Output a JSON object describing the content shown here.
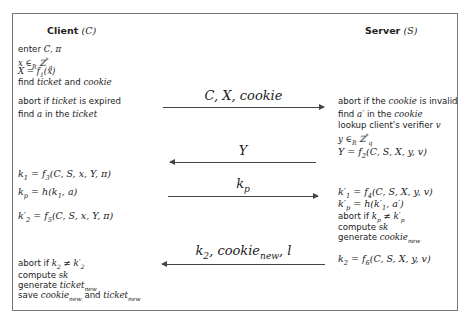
{
  "diagram": {
    "type": "protocol-sequence",
    "client": {
      "title": "Client",
      "symbol": "(C)",
      "steps": [
        "enter C, π",
        "x ∈R Z*q",
        "X = f1(x)",
        "find ticket and cookie",
        "abort if ticket is expired",
        "find a in the ticket",
        "k1 = f3(C, S, x, Y, π)",
        "kp = h(k1, a)",
        "k'2 = f5(C, S, x, Y, π)",
        "abort if k2 ≠ k'2",
        "compute sk",
        "generate ticket_new",
        "save cookie_new and ticket_new"
      ]
    },
    "server": {
      "title": "Server",
      "symbol": "(S)",
      "steps": [
        "abort if the cookie is invalid",
        "find a' in the cookie",
        "lookup client's verifier v",
        "y ∈R Z*q",
        "Y = f2(C, S, X, y, v)",
        "k'1 = f4(C, S, X, y, v)",
        "k'p = h(k'1, a')",
        "abort if kp ≠ k'p",
        "compute sk",
        "generate cookie_new",
        "k2 = f6(C, S, X, y, v)"
      ]
    },
    "messages": [
      {
        "direction": "client-to-server",
        "label": "C, X, cookie"
      },
      {
        "direction": "server-to-client",
        "label": "Y"
      },
      {
        "direction": "client-to-server",
        "label": "kp"
      },
      {
        "direction": "server-to-client",
        "label": "k2, cookie_new, l"
      }
    ]
  },
  "text": {
    "client_title": "Client",
    "server_title": "Server",
    "enter": "enter",
    "find": "find",
    "and": "and",
    "abort_if": "abort if",
    "is_expired": "is expired",
    "in_the": "in the",
    "compute": "compute",
    "generate": "generate",
    "save": "save",
    "abort_if_the": "abort if the",
    "is_invalid": "is invalid",
    "lookup": "lookup client's verifier",
    "ticket": "ticket",
    "cookie": "cookie",
    "new": "new",
    "sk": "sk"
  }
}
